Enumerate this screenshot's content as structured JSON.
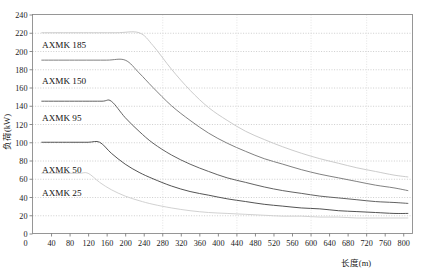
{
  "chart_data": {
    "type": "line",
    "title": "",
    "xlabel": "长度(m)",
    "ylabel": "负荷(kW)",
    "xlim": [
      0,
      820
    ],
    "ylim": [
      0,
      240
    ],
    "grid": true,
    "grid_style": "dotted",
    "legend_position": "inline-left-labels",
    "xticks": [
      40,
      80,
      120,
      160,
      200,
      240,
      280,
      320,
      360,
      400,
      440,
      480,
      520,
      560,
      600,
      640,
      680,
      720,
      760,
      800
    ],
    "yticks": [
      0,
      20,
      40,
      60,
      80,
      100,
      120,
      140,
      160,
      180,
      200,
      220,
      240
    ],
    "series": [
      {
        "name": "AXMK 185",
        "color": "#c8c8c8",
        "plateau_value": 220,
        "knee_x": 230,
        "x": [
          20,
          100,
          180,
          230,
          260,
          300,
          340,
          380,
          420,
          460,
          500,
          540,
          580,
          620,
          660,
          700,
          740,
          780,
          810
        ],
        "values": [
          220,
          220,
          220,
          220,
          206,
          180,
          157,
          138,
          124,
          112,
          103,
          95,
          88,
          82,
          77,
          72,
          68,
          64,
          62
        ]
      },
      {
        "name": "AXMK 150",
        "color": "#7a7a7a",
        "plateau_value": 190,
        "knee_x": 200,
        "x": [
          20,
          100,
          160,
          200,
          230,
          260,
          300,
          340,
          380,
          420,
          460,
          500,
          540,
          580,
          620,
          660,
          700,
          740,
          780,
          810
        ],
        "values": [
          190,
          190,
          190,
          190,
          176,
          160,
          140,
          124,
          110,
          99,
          90,
          82,
          76,
          70,
          65,
          61,
          57,
          53,
          50,
          47
        ]
      },
      {
        "name": "AXMK 95",
        "color": "#5a5a5a",
        "plateau_value": 145,
        "knee_x": 170,
        "x": [
          20,
          100,
          150,
          170,
          200,
          230,
          260,
          300,
          340,
          380,
          420,
          460,
          500,
          540,
          580,
          620,
          660,
          700,
          740,
          780,
          810
        ],
        "values": [
          145,
          145,
          145,
          145,
          127,
          112,
          99,
          86,
          76,
          68,
          61,
          56,
          51,
          47,
          44,
          41,
          39,
          37,
          35,
          34,
          33
        ]
      },
      {
        "name": "AXMK 50",
        "color": "#4a4a4a",
        "plateau_value": 100,
        "knee_x": 145,
        "x": [
          20,
          80,
          120,
          145,
          170,
          200,
          230,
          260,
          300,
          340,
          380,
          420,
          460,
          500,
          540,
          580,
          620,
          660,
          700,
          740,
          780,
          810
        ],
        "values": [
          100,
          100,
          100,
          100,
          88,
          76,
          67,
          60,
          52,
          46,
          42,
          38,
          35,
          32,
          30,
          28,
          27,
          25,
          24,
          23,
          22,
          22
        ]
      },
      {
        "name": "AXMK 25",
        "color": "#cfcfcf",
        "plateau_value": 66,
        "knee_x": 120,
        "x": [
          20,
          60,
          100,
          120,
          145,
          170,
          200,
          230,
          260,
          300,
          340,
          380,
          420,
          460,
          500,
          540,
          580,
          620,
          660,
          700,
          740,
          780,
          810
        ],
        "values": [
          66,
          66,
          66,
          66,
          56,
          48,
          41,
          36,
          32,
          28,
          25,
          23,
          22,
          21,
          20,
          19,
          19,
          18,
          18,
          17,
          17,
          17,
          17
        ]
      }
    ],
    "series_labels": [
      {
        "text": "AXMK 185",
        "x_px": 42,
        "y_px": 48
      },
      {
        "text": "AXMK 150",
        "x_px": 42,
        "y_px": 84
      },
      {
        "text": "AXMK 95",
        "x_px": 42,
        "y_px": 121
      },
      {
        "text": "AXMK 50",
        "x_px": 42,
        "y_px": 173
      },
      {
        "text": "AXMK 25",
        "x_px": 42,
        "y_px": 196
      }
    ]
  }
}
